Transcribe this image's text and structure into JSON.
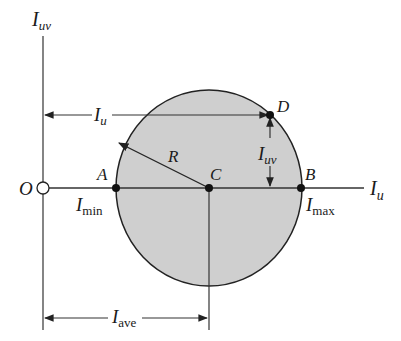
{
  "diagram": {
    "colors": {
      "line": "#222222",
      "circle_fill": "#cfcfcf",
      "background": "#ffffff"
    },
    "axes": {
      "vertical_label_main": "I",
      "vertical_label_sub": "uv",
      "horizontal_label_main": "I",
      "horizontal_label_sub": "u",
      "origin_label": "O"
    },
    "points": {
      "A": "A",
      "B": "B",
      "C": "C",
      "D": "D"
    },
    "labels": {
      "radius": "R",
      "i_min_main": "I",
      "i_min_sub": "min",
      "i_max_main": "I",
      "i_max_sub": "max",
      "i_u_main": "I",
      "i_u_sub": "u",
      "i_uv_main": "I",
      "i_uv_sub": "uv",
      "i_ave_main": "I",
      "i_ave_sub": "ave"
    }
  }
}
